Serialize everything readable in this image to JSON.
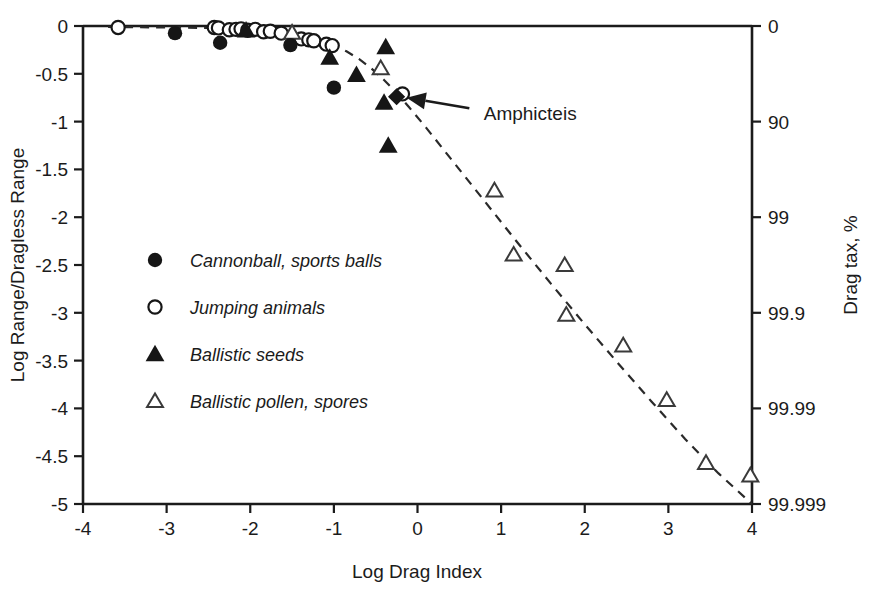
{
  "chart_data": {
    "type": "scatter",
    "title": "",
    "xlabel": "Log Drag Index",
    "ylabel": "Log Range/Dragless Range",
    "ylabel_right": "Drag tax, %",
    "xlim": [
      -4,
      4
    ],
    "ylim": [
      -5,
      0
    ],
    "grid": false,
    "legend_position": "inside-left-middle",
    "xticks": [
      "-4",
      "-3",
      "-2",
      "-1",
      "0",
      "1",
      "2",
      "3",
      "4"
    ],
    "xtick_values": [
      -4,
      -3,
      -2,
      -1,
      0,
      1,
      2,
      3,
      4
    ],
    "yticks_left": [
      "0",
      "-0.5",
      "-1",
      "-1.5",
      "-2",
      "-2.5",
      "-3",
      "-3.5",
      "-4",
      "-4.5",
      "-5"
    ],
    "ytick_left_values": [
      0,
      -0.5,
      -1,
      -1.5,
      -2,
      -2.5,
      -3,
      -3.5,
      -4,
      -4.5,
      -5
    ],
    "yticks_right": [
      "0",
      "90",
      "99",
      "99.9",
      "99.99",
      "99.999"
    ],
    "ytick_right_values": [
      0,
      -1,
      -2,
      -3,
      -4,
      -5
    ],
    "annotations": [
      {
        "text": "Amphicteis",
        "text_x": 0.72,
        "text_y": -0.92,
        "arrow_from_x": 0.62,
        "arrow_from_y": -0.86,
        "arrow_to_x": -0.13,
        "arrow_to_y": -0.75
      }
    ],
    "series": [
      {
        "name": "Cannonball, sports balls",
        "marker": "filled-circle",
        "color": "#161616",
        "points": [
          [
            -2.9,
            -0.075
          ],
          [
            -2.36,
            -0.175
          ],
          [
            -1.52,
            -0.2
          ],
          [
            -1.0,
            -0.645
          ]
        ]
      },
      {
        "name": "Jumping animals",
        "marker": "open-circle",
        "color": "#161616",
        "points": [
          [
            -3.58,
            -0.015
          ],
          [
            -2.43,
            -0.015
          ],
          [
            -2.38,
            -0.02
          ],
          [
            -2.25,
            -0.04
          ],
          [
            -2.17,
            -0.035
          ],
          [
            -2.11,
            -0.03
          ],
          [
            -2.03,
            -0.045
          ],
          [
            -1.94,
            -0.035
          ],
          [
            -1.84,
            -0.06
          ],
          [
            -1.76,
            -0.055
          ],
          [
            -1.63,
            -0.075
          ],
          [
            -1.39,
            -0.135
          ],
          [
            -1.3,
            -0.145
          ],
          [
            -1.24,
            -0.155
          ],
          [
            -1.09,
            -0.19
          ],
          [
            -1.02,
            -0.205
          ],
          [
            -0.18,
            -0.71
          ]
        ]
      },
      {
        "name": "Ballistic seeds",
        "marker": "filled-triangle",
        "color": "#161616",
        "points": [
          [
            -2.05,
            -0.045
          ],
          [
            -1.05,
            -0.33
          ],
          [
            -0.73,
            -0.51
          ],
          [
            -0.38,
            -0.22
          ],
          [
            -0.4,
            -0.8
          ],
          [
            -0.35,
            -1.25
          ]
        ]
      },
      {
        "name": "Ballistic pollen, spores",
        "marker": "open-triangle",
        "color": "#3a3a3a",
        "points": [
          [
            -1.5,
            -0.07
          ],
          [
            -0.44,
            -0.44
          ],
          [
            0.92,
            -1.72
          ],
          [
            1.15,
            -2.39
          ],
          [
            1.76,
            -2.5
          ],
          [
            1.78,
            -3.02
          ],
          [
            2.46,
            -3.34
          ],
          [
            2.98,
            -3.91
          ],
          [
            3.45,
            -4.57
          ],
          [
            3.98,
            -4.7
          ]
        ]
      },
      {
        "name": "Amphicteis",
        "marker": "filled-diamond",
        "color": "#161616",
        "points": [
          [
            -0.25,
            -0.74
          ]
        ]
      }
    ],
    "fit_curve": {
      "style": "dashed",
      "description": "dashed trend curve through data",
      "points": [
        [
          -3.7,
          -0.01
        ],
        [
          -3.0,
          -0.015
        ],
        [
          -2.4,
          -0.022
        ],
        [
          -2.05,
          -0.035
        ],
        [
          -1.8,
          -0.055
        ],
        [
          -1.6,
          -0.075
        ],
        [
          -1.4,
          -0.105
        ],
        [
          -1.2,
          -0.145
        ],
        [
          -1.0,
          -0.205
        ],
        [
          -0.85,
          -0.265
        ],
        [
          -0.7,
          -0.345
        ],
        [
          -0.55,
          -0.445
        ],
        [
          -0.4,
          -0.565
        ],
        [
          -0.25,
          -0.7
        ],
        [
          -0.1,
          -0.85
        ],
        [
          0.1,
          -1.06
        ],
        [
          0.4,
          -1.39
        ],
        [
          0.8,
          -1.83
        ],
        [
          1.2,
          -2.27
        ],
        [
          1.6,
          -2.7
        ],
        [
          2.0,
          -3.12
        ],
        [
          2.4,
          -3.53
        ],
        [
          2.8,
          -3.93
        ],
        [
          3.2,
          -4.32
        ],
        [
          3.6,
          -4.68
        ],
        [
          4.0,
          -5.0
        ]
      ]
    }
  },
  "legend": {
    "items": [
      {
        "label": "Cannonball, sports balls",
        "marker": "filled-circle"
      },
      {
        "label": "Jumping animals",
        "marker": "open-circle"
      },
      {
        "label": "Ballistic seeds",
        "marker": "filled-triangle"
      },
      {
        "label": "Ballistic pollen, spores",
        "marker": "open-triangle"
      }
    ]
  }
}
